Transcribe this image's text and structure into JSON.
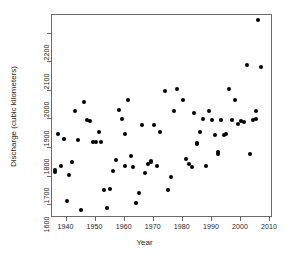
{
  "chart_data": {
    "type": "scatter",
    "title": "",
    "xlabel": "Year",
    "ylabel": "Discharge (cubic kilometers)",
    "xlim": [
      1935,
      2011
    ],
    "ylim": [
      1555,
      2265
    ],
    "xticks": [
      1940,
      1950,
      1960,
      1970,
      1980,
      1990,
      2000,
      2010
    ],
    "yticks": [
      1600,
      1700,
      1800,
      1900,
      2000,
      2100,
      2200
    ],
    "grid": false,
    "legend": null,
    "marker": "filled-circle",
    "marker_color": "#000000",
    "points": [
      {
        "x": 1936,
        "y": 1724
      },
      {
        "x": 1936,
        "y": 1716
      },
      {
        "x": 1937,
        "y": 1848
      },
      {
        "x": 1938,
        "y": 1737
      },
      {
        "x": 1939,
        "y": 1833
      },
      {
        "x": 1940,
        "y": 1616
      },
      {
        "x": 1941,
        "y": 1704
      },
      {
        "x": 1942,
        "y": 1752
      },
      {
        "x": 1943,
        "y": 1928
      },
      {
        "x": 1944,
        "y": 1829
      },
      {
        "x": 1945,
        "y": 1582
      },
      {
        "x": 1946,
        "y": 1959
      },
      {
        "x": 1947,
        "y": 1899
      },
      {
        "x": 1948,
        "y": 1893
      },
      {
        "x": 1949,
        "y": 1821
      },
      {
        "x": 1950,
        "y": 1822
      },
      {
        "x": 1951,
        "y": 1855
      },
      {
        "x": 1952,
        "y": 1821
      },
      {
        "x": 1953,
        "y": 1654
      },
      {
        "x": 1954,
        "y": 1589
      },
      {
        "x": 1955,
        "y": 1657
      },
      {
        "x": 1956,
        "y": 1718
      },
      {
        "x": 1957,
        "y": 1757
      },
      {
        "x": 1958,
        "y": 1934
      },
      {
        "x": 1959,
        "y": 1903
      },
      {
        "x": 1960,
        "y": 1850
      },
      {
        "x": 1960,
        "y": 1736
      },
      {
        "x": 1961,
        "y": 1967
      },
      {
        "x": 1962,
        "y": 1772
      },
      {
        "x": 1963,
        "y": 1733
      },
      {
        "x": 1964,
        "y": 1606
      },
      {
        "x": 1965,
        "y": 1644
      },
      {
        "x": 1966,
        "y": 1881
      },
      {
        "x": 1967,
        "y": 1712
      },
      {
        "x": 1968,
        "y": 1745
      },
      {
        "x": 1969,
        "y": 1752
      },
      {
        "x": 1969,
        "y": 1755
      },
      {
        "x": 1970,
        "y": 1879
      },
      {
        "x": 1971,
        "y": 1738
      },
      {
        "x": 1972,
        "y": 1855
      },
      {
        "x": 1974,
        "y": 2000
      },
      {
        "x": 1975,
        "y": 1654
      },
      {
        "x": 1976,
        "y": 1698
      },
      {
        "x": 1977,
        "y": 1928
      },
      {
        "x": 1978,
        "y": 2005
      },
      {
        "x": 1980,
        "y": 1966
      },
      {
        "x": 1981,
        "y": 1762
      },
      {
        "x": 1982,
        "y": 1743
      },
      {
        "x": 1983,
        "y": 1735
      },
      {
        "x": 1984,
        "y": 1921
      },
      {
        "x": 1985,
        "y": 1816
      },
      {
        "x": 1985,
        "y": 1815
      },
      {
        "x": 1986,
        "y": 1855
      },
      {
        "x": 1987,
        "y": 1903
      },
      {
        "x": 1988,
        "y": 1738
      },
      {
        "x": 1989,
        "y": 1930
      },
      {
        "x": 1990,
        "y": 1899
      },
      {
        "x": 1991,
        "y": 1846
      },
      {
        "x": 1992,
        "y": 1786
      },
      {
        "x": 1992,
        "y": 1779
      },
      {
        "x": 1993,
        "y": 1897
      },
      {
        "x": 1994,
        "y": 1845
      },
      {
        "x": 1995,
        "y": 1848
      },
      {
        "x": 1996,
        "y": 2005
      },
      {
        "x": 1997,
        "y": 1898
      },
      {
        "x": 1998,
        "y": 1967
      },
      {
        "x": 1999,
        "y": 1885
      },
      {
        "x": 2000,
        "y": 1896
      },
      {
        "x": 2001,
        "y": 1891
      },
      {
        "x": 2002,
        "y": 2089
      },
      {
        "x": 2003,
        "y": 1779
      },
      {
        "x": 2004,
        "y": 1898
      },
      {
        "x": 2005,
        "y": 1928
      },
      {
        "x": 2005,
        "y": 1903
      },
      {
        "x": 2006,
        "y": 2247
      },
      {
        "x": 2007,
        "y": 2084
      }
    ]
  }
}
